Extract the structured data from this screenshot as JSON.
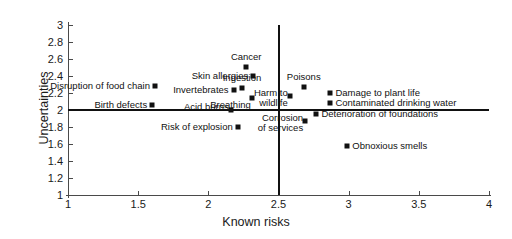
{
  "chart_data": {
    "type": "scatter",
    "title": "",
    "xlabel": "Known risks",
    "ylabel": "Uncertainties",
    "xlim": [
      1,
      4
    ],
    "ylim": [
      1,
      3
    ],
    "xticks": [
      "1",
      "1.5",
      "2",
      "2.5",
      "3",
      "3.5",
      "4"
    ],
    "xtick_values": [
      1,
      1.5,
      2,
      2.5,
      3,
      3.5,
      4
    ],
    "yticks": [
      "1",
      "1.2",
      "1.4",
      "1.6",
      "1.8",
      "2",
      "2.2",
      "2.4",
      "2.6",
      "2.8",
      "3"
    ],
    "ytick_values": [
      1,
      1.2,
      1.4,
      1.6,
      1.8,
      2,
      2.2,
      2.4,
      2.6,
      2.8,
      3
    ],
    "grid": false,
    "legend": "none",
    "reference_lines": [
      {
        "axis": "horizontal",
        "value": 2.0
      },
      {
        "axis": "vertical",
        "value": 2.5
      }
    ],
    "marker_shape": "square",
    "marker_color": "#111111",
    "points": [
      {
        "label": "Disruption of food chain",
        "x": 1.62,
        "y": 2.28,
        "align": "right"
      },
      {
        "label": "Birth defects",
        "x": 1.6,
        "y": 2.06,
        "align": "right"
      },
      {
        "label": "Cancer",
        "x": 2.27,
        "y": 2.51,
        "align": "above"
      },
      {
        "label": "Skin allergies",
        "x": 2.32,
        "y": 2.4,
        "align": "right"
      },
      {
        "label": "Ingestion",
        "x": 2.24,
        "y": 2.26,
        "align": "above"
      },
      {
        "label": "Invertebrates",
        "x": 2.18,
        "y": 2.23,
        "align": "right"
      },
      {
        "label": "Breathing",
        "x": 2.31,
        "y": 2.14,
        "align": "below-right"
      },
      {
        "label": "Acid burns",
        "x": 2.16,
        "y": 2.0,
        "align": "below-left"
      },
      {
        "label": "Risk of explosion",
        "x": 2.21,
        "y": 1.8,
        "align": "right"
      },
      {
        "label": "Poisons",
        "x": 2.68,
        "y": 2.27,
        "align": "above"
      },
      {
        "label": "Harm to wildlife",
        "x": 2.58,
        "y": 2.16,
        "align": "below-left"
      },
      {
        "label": "Damage to plant life",
        "x": 2.87,
        "y": 2.2,
        "align": "left"
      },
      {
        "label": "Contaminated drinking water",
        "x": 2.87,
        "y": 2.08,
        "align": "left"
      },
      {
        "label": "Deterioration of foundations",
        "x": 2.77,
        "y": 1.95,
        "align": "left"
      },
      {
        "label": "Corrosion of services",
        "x": 2.69,
        "y": 1.87,
        "align": "below-left"
      },
      {
        "label": "Obnoxious smells",
        "x": 2.99,
        "y": 1.58,
        "align": "left"
      }
    ]
  }
}
